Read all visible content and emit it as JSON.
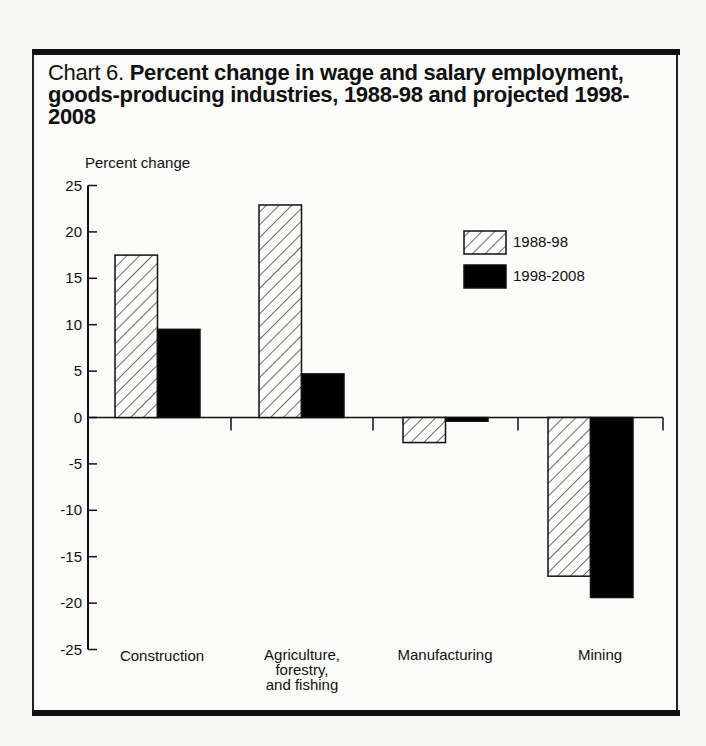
{
  "title": {
    "prefix": "Chart 6. ",
    "main": "Percent change in wage and salary employment, goods-producing industries, 1988-98 and projected 1998-2008"
  },
  "axis": {
    "ylabel": "Percent change",
    "yticks": [
      "25",
      "20",
      "15",
      "10",
      "5",
      "0",
      "-5",
      "-10",
      "-15",
      "-20",
      "-25"
    ]
  },
  "legend": {
    "items": [
      {
        "label": "1988-98",
        "style": "hatched"
      },
      {
        "label": "1998-2008",
        "style": "solid-black"
      }
    ]
  },
  "categories": {
    "construction": "Construction",
    "agriculture_l1": "Agriculture,",
    "agriculture_l2": "forestry,",
    "agriculture_l3": "and fishing",
    "manufacturing": "Manufacturing",
    "mining": "Mining"
  },
  "chart_data": {
    "type": "bar",
    "title": "Chart 6. Percent change in wage and salary employment, goods-producing industries, 1988-98 and projected 1998-2008",
    "xlabel": "",
    "ylabel": "Percent change",
    "categories": [
      "Construction",
      "Agriculture, forestry, and fishing",
      "Manufacturing",
      "Mining"
    ],
    "series": [
      {
        "name": "1988-98",
        "pattern": "hatched",
        "values": [
          17.5,
          22.9,
          -2.7,
          -17.1
        ]
      },
      {
        "name": "1998-2008",
        "pattern": "solid",
        "color": "#000000",
        "values": [
          9.5,
          4.7,
          -0.4,
          -19.4
        ]
      }
    ],
    "ylim": [
      -25,
      25
    ],
    "yticks": [
      -25,
      -20,
      -15,
      -10,
      -5,
      0,
      5,
      10,
      15,
      20,
      25
    ],
    "grid": false,
    "legend_position": "upper right, inside plot"
  }
}
